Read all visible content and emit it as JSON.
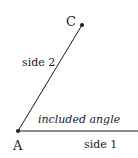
{
  "diagram": {
    "points": {
      "A": {
        "label": "A",
        "x": 18,
        "y": 131
      },
      "C": {
        "label": "C",
        "x": 82,
        "y": 25
      }
    },
    "labels": {
      "side1": "side 1",
      "side2": "side 2",
      "angle": "included angle"
    },
    "colors": {
      "line": "#1a1a1a",
      "text": "#1a1a1a",
      "background": "#ffffff"
    }
  }
}
